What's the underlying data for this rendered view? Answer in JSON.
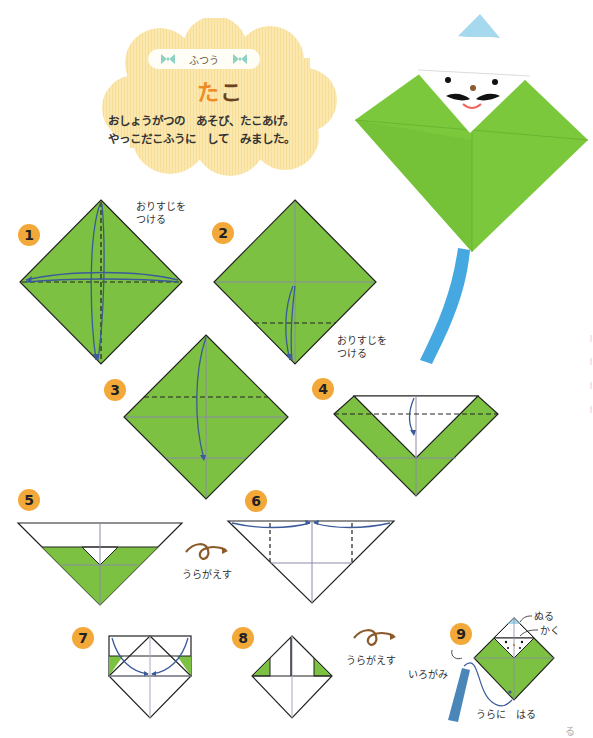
{
  "header": {
    "level_label": "ふつう",
    "title_part1": "た",
    "title_part2": "こ",
    "intro_line1": "おしょうがつの　あそび、たこあげ。",
    "intro_line2": "やっこだこふうに　して　みました。"
  },
  "colors": {
    "paper_green": "#7dc142",
    "kite_green": "#7cc83c",
    "badge_orange": "#f3a83a",
    "title_orange": "#ef8a24",
    "title_brown": "#6b4322",
    "arrow_blue": "#3a5a9a",
    "tail_blue": "#46a8e0",
    "cloud_yellow": "#fbe7a8",
    "flip_brown": "#8a5a2a"
  },
  "photo": {
    "alt": "finished yakko-style kite with face and blue tail"
  },
  "steps": [
    {
      "number": "1",
      "note": [
        "おりすじを",
        "つける"
      ]
    },
    {
      "number": "2",
      "note": [
        "おりすじを",
        "つける"
      ]
    },
    {
      "number": "3"
    },
    {
      "number": "4"
    },
    {
      "number": "5",
      "flip_label": "うらがえす"
    },
    {
      "number": "6"
    },
    {
      "number": "7"
    },
    {
      "number": "8",
      "flip_label": "うらがえす"
    },
    {
      "number": "9",
      "labels": {
        "paint": "ぬる",
        "draw": "かく",
        "colored_paper": "いろがみ",
        "stick_back": "うらに　はる"
      }
    }
  ],
  "footer": {
    "page_fragment": "る"
  }
}
